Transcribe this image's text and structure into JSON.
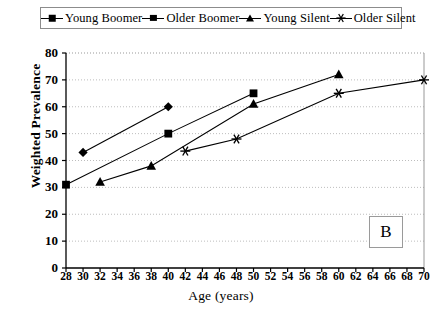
{
  "chart_data": {
    "type": "line",
    "title": "",
    "subtitle": "",
    "xlabel": "Age (years)",
    "ylabel": "Weighted Prevalence",
    "xlim": [
      28,
      70
    ],
    "ylim": [
      0,
      80
    ],
    "xticks": [
      28,
      30,
      32,
      34,
      36,
      38,
      40,
      42,
      44,
      46,
      48,
      50,
      52,
      54,
      56,
      58,
      60,
      62,
      64,
      66,
      68,
      70
    ],
    "yticks": [
      0,
      10,
      20,
      30,
      40,
      50,
      60,
      70,
      80
    ],
    "grid": "horizontal-dotted",
    "legend_position": "top",
    "panel_label": "B",
    "series": [
      {
        "name": "Young Boomer",
        "marker": "diamond",
        "points": [
          {
            "x": 30,
            "y": 43
          },
          {
            "x": 40,
            "y": 60
          }
        ]
      },
      {
        "name": "Older Boomer",
        "marker": "square",
        "points": [
          {
            "x": 28,
            "y": 31
          },
          {
            "x": 40,
            "y": 50
          },
          {
            "x": 50,
            "y": 65
          }
        ]
      },
      {
        "name": "Young Silent",
        "marker": "triangle",
        "points": [
          {
            "x": 32,
            "y": 32
          },
          {
            "x": 38,
            "y": 38
          },
          {
            "x": 50,
            "y": 61
          },
          {
            "x": 60,
            "y": 72
          }
        ]
      },
      {
        "name": "Older Silent",
        "marker": "asterisk",
        "points": [
          {
            "x": 42,
            "y": 43.5
          },
          {
            "x": 48,
            "y": 48
          },
          {
            "x": 60,
            "y": 65
          },
          {
            "x": 70,
            "y": 70
          }
        ]
      }
    ]
  },
  "legend": {
    "items": [
      {
        "label": "Young Boomer",
        "marker": "diamond"
      },
      {
        "label": "Older Boomer",
        "marker": "square"
      },
      {
        "label": "Young Silent",
        "marker": "triangle"
      },
      {
        "label": "Older Silent",
        "marker": "asterisk"
      }
    ]
  },
  "axes": {
    "y_title": "Weighted Prevalence",
    "x_title": "Age (years)"
  },
  "panel": {
    "label": "B"
  }
}
